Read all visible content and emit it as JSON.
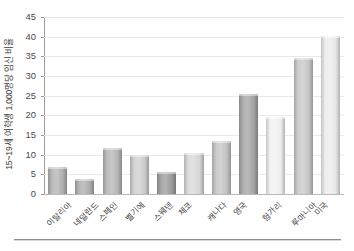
{
  "chart_data": {
    "type": "bar",
    "title": "",
    "subtitle": "",
    "xlabel": "",
    "ylabel": "15~19세 여학생 1,000명당 임신 비율",
    "categories": [
      "이탈리아",
      "네덜란드",
      "스페인",
      "벨기에",
      "스웨덴",
      "체코",
      "캐나다",
      "영국",
      "헝가리",
      "루마니아",
      "미국"
    ],
    "values": [
      6.8,
      3.8,
      11.7,
      9.8,
      5.6,
      10.5,
      13.5,
      25.5,
      19.6,
      34.5,
      40.3
    ],
    "ylim": [
      0,
      45
    ],
    "yticks": [
      0,
      5,
      10,
      15,
      20,
      25,
      30,
      35,
      40,
      45
    ],
    "ytick_labels": [
      "0",
      "5",
      "10",
      "15",
      "20",
      "25",
      "30",
      "35",
      "40",
      "45"
    ],
    "grid": true,
    "grid_axis": "y",
    "legend": false,
    "legend_position": "none",
    "bar_colors": [
      "#b4b4b4",
      "#b0b0b0",
      "#b8b8b8",
      "#cfcfcf",
      "#9e9e9e",
      "#dadada",
      "#c6c6c6",
      "#a6a6a6",
      "#f2f2f2",
      "#c9c9c9",
      "#ececec"
    ],
    "annotations": []
  },
  "colors": {
    "background": "#ffffff",
    "gridline": "#e9e9e9",
    "axis": "#9a9a9a",
    "baseline": "#b9b9b9",
    "text": "#3d3d3d",
    "rule": "#8d8d8d"
  }
}
